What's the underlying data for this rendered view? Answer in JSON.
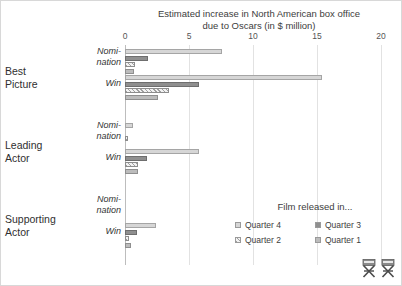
{
  "chart_data": {
    "type": "bar",
    "orientation": "horizontal",
    "title": "Estimated increase in North American box office due to Oscars (in $ million)",
    "title_lines": [
      "Estimated increase in North American box office",
      "due to Oscars (in $ million)"
    ],
    "xlabel": "",
    "ylabel": "",
    "xlim": [
      0,
      20
    ],
    "xticks": [
      0,
      5,
      10,
      15,
      20
    ],
    "xtick_labels": [
      "0",
      "5",
      "10",
      "15",
      "20"
    ],
    "grid": true,
    "legend_position": "inside-bottom-right",
    "legend_title": "Film released in...",
    "series": [
      {
        "name": "Quarter 4",
        "key": "q4",
        "color": "#d6d6d6"
      },
      {
        "name": "Quarter 3",
        "key": "q3",
        "color": "#8f8f8f"
      },
      {
        "name": "Quarter 2",
        "key": "q2",
        "color": "#f2f2f2"
      },
      {
        "name": "Quarter 1",
        "key": "q1",
        "color": "#bcbcbc"
      }
    ],
    "groups": [
      {
        "category": "Best Picture",
        "category_lines": [
          "Best",
          "Picture"
        ],
        "subgroups": [
          {
            "label": "Nomination",
            "label_lines": [
              "Nomi-",
              "nation"
            ],
            "values": {
              "q4": 7.6,
              "q3": 1.8,
              "q2": 0.8,
              "q1": 0.7
            }
          },
          {
            "label": "Win",
            "label_lines": [
              "Win"
            ],
            "values": {
              "q4": 15.4,
              "q3": 5.8,
              "q2": 3.4,
              "q1": 2.6
            }
          }
        ]
      },
      {
        "category": "Leading Actor",
        "category_lines": [
          "Leading",
          "Actor"
        ],
        "subgroups": [
          {
            "label": "Nomination",
            "label_lines": [
              "Nomi-",
              "nation"
            ],
            "values": {
              "q4": 0.6,
              "q3": 0.0,
              "q2": 0.25,
              "q1": 0.0
            }
          },
          {
            "label": "Win",
            "label_lines": [
              "Win"
            ],
            "values": {
              "q4": 5.8,
              "q3": 1.7,
              "q2": 1.0,
              "q1": 1.0
            }
          }
        ]
      },
      {
        "category": "Supporting Actor",
        "category_lines": [
          "Supporting",
          "Actor"
        ],
        "subgroups": [
          {
            "label": "Nomination",
            "label_lines": [
              "Nomi-",
              "nation"
            ],
            "values": {
              "q4": 0.0,
              "q3": 0.0,
              "q2": 0.0,
              "q1": 0.0
            }
          },
          {
            "label": "Win",
            "label_lines": [
              "Win"
            ],
            "values": {
              "q4": 2.4,
              "q3": 0.9,
              "q2": 0.3,
              "q1": 0.45
            }
          }
        ]
      }
    ]
  },
  "decorations": {
    "chair_icon_left": "director-chair-icon",
    "chair_icon_right": "director-chair-icon"
  }
}
